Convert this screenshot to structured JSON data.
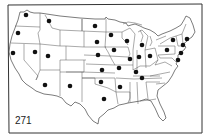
{
  "figure": {
    "label": "271",
    "frame_color": "#333333",
    "line_color": "#444444",
    "dot_color": "#111111"
  },
  "map": {
    "title": "",
    "region": "Contiguous United States",
    "markers": [
      {
        "id": "wa",
        "x": 26,
        "y": 15
      },
      {
        "id": "mt",
        "x": 49,
        "y": 21
      },
      {
        "id": "or",
        "x": 18,
        "y": 33
      },
      {
        "id": "ca",
        "x": 13,
        "y": 53
      },
      {
        "id": "nv",
        "x": 35,
        "y": 52
      },
      {
        "id": "ut",
        "x": 48,
        "y": 56
      },
      {
        "id": "az",
        "x": 45,
        "y": 85
      },
      {
        "id": "nm",
        "x": 70,
        "y": 86
      },
      {
        "id": "nd",
        "x": 95,
        "y": 26
      },
      {
        "id": "sd",
        "x": 97,
        "y": 42
      },
      {
        "id": "ne",
        "x": 98,
        "y": 55
      },
      {
        "id": "ks",
        "x": 102,
        "y": 70
      },
      {
        "id": "ok",
        "x": 101,
        "y": 82
      },
      {
        "id": "tx",
        "x": 104,
        "y": 99
      },
      {
        "id": "mn",
        "x": 111,
        "y": 35
      },
      {
        "id": "ia",
        "x": 114,
        "y": 50
      },
      {
        "id": "mo",
        "x": 119,
        "y": 68
      },
      {
        "id": "ar",
        "x": 120,
        "y": 87
      },
      {
        "id": "wi",
        "x": 127,
        "y": 41
      },
      {
        "id": "il",
        "x": 130,
        "y": 59
      },
      {
        "id": "in",
        "x": 139,
        "y": 57
      },
      {
        "id": "mi",
        "x": 142,
        "y": 45
      },
      {
        "id": "oh",
        "x": 150,
        "y": 56
      },
      {
        "id": "ky",
        "x": 136,
        "y": 72
      },
      {
        "id": "tn",
        "x": 142,
        "y": 78
      },
      {
        "id": "pa",
        "x": 167,
        "y": 50
      },
      {
        "id": "ny",
        "x": 173,
        "y": 40
      },
      {
        "id": "me",
        "x": 187,
        "y": 39
      },
      {
        "id": "ma",
        "x": 183,
        "y": 45
      },
      {
        "id": "ct",
        "x": 181,
        "y": 53
      },
      {
        "id": "nj",
        "x": 178,
        "y": 60
      }
    ]
  }
}
